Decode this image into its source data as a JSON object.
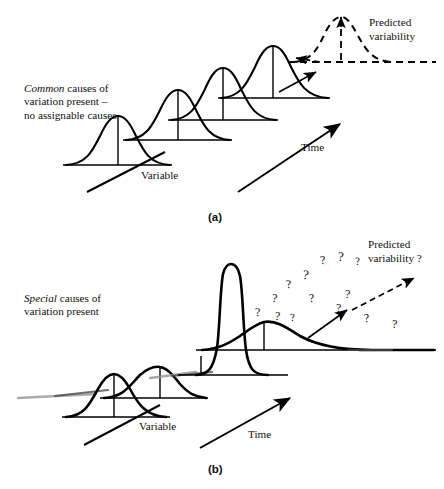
{
  "figure": {
    "background_color": "#ffffff",
    "ink_color": "#000000"
  },
  "panel_a": {
    "caption": "(a)",
    "note_emphasis": "Common",
    "note_rest": " causes of\nvariation present –\nno assignable causes",
    "note_line1_em": "Common",
    "note_line1_rest": " causes of",
    "note_line2": "variation present –",
    "note_line3": "no assignable causes",
    "variable_axis_label": "Variable",
    "time_axis_label": "Time",
    "predicted_label_line1": "Predicted",
    "predicted_label_line2": "variability"
  },
  "panel_b": {
    "caption": "(b)",
    "note_line1_em": "Special",
    "note_line1_rest": " causes of",
    "note_line2": "variation present",
    "variable_axis_label": "Variable",
    "time_axis_label": "Time",
    "predicted_label_line1": "Predicted",
    "predicted_label_line2": "variability ?",
    "question_marks": [
      "?",
      "?",
      "?",
      "?",
      "?",
      "?",
      "?",
      "?",
      "?",
      "?",
      "?",
      "?",
      "?",
      "?"
    ]
  },
  "chart_data": {
    "type": "line",
    "xlabel": "Variable",
    "ylabel": "",
    "grid": false,
    "legend_position": "none",
    "panels": [
      {
        "id": "a",
        "caption": "(a)",
        "description": "Common causes of variation present - no assignable causes. Four identical stable normal distributions shifting up and to the right along the Time axis, plus one dashed predicted distribution.",
        "distributions": [
          {
            "index": 1,
            "style": "solid",
            "center_x": 118,
            "baseline_y": 165,
            "peak_y": 116,
            "half_width": 53,
            "shape": "normal",
            "stable": true
          },
          {
            "index": 2,
            "style": "solid",
            "center_x": 178,
            "baseline_y": 140,
            "peak_y": 90,
            "half_width": 53,
            "shape": "normal",
            "stable": true
          },
          {
            "index": 3,
            "style": "solid",
            "center_x": 222,
            "baseline_y": 120,
            "peak_y": 68,
            "half_width": 53,
            "shape": "normal",
            "stable": true
          },
          {
            "index": 4,
            "style": "solid",
            "center_x": 272,
            "baseline_y": 98,
            "peak_y": 47,
            "half_width": 53,
            "shape": "normal",
            "stable": true
          },
          {
            "index": 5,
            "style": "dashed",
            "center_x": 340,
            "baseline_y": 62,
            "peak_y": 17,
            "half_width": 52,
            "shape": "normal",
            "stable": true,
            "label": "Predicted variability"
          }
        ],
        "axes": {
          "time_arrow": true,
          "variable_arrow": true
        }
      },
      {
        "id": "b",
        "caption": "(b)",
        "description": "Special causes of variation present. Distributions change shape and spread unpredictably; predicted variability is unknown, shown with question marks.",
        "distributions": [
          {
            "index": 1,
            "style": "solid",
            "center_x": 110,
            "baseline_y": 417,
            "peak_y": 375,
            "half_width": 48,
            "shape": "normal",
            "stable": false
          },
          {
            "index": 2,
            "style": "solid",
            "center_x": 158,
            "baseline_y": 398,
            "peak_y": 368,
            "half_width": 50,
            "shape": "wide-flat",
            "stable": false
          },
          {
            "index": 3,
            "style": "solid",
            "center_x": 224,
            "baseline_y": 375,
            "peak_y": 265,
            "half_width": 32,
            "shape": "tall-narrow",
            "stable": false
          },
          {
            "index": 4,
            "style": "solid",
            "center_x": 268,
            "baseline_y": 350,
            "peak_y": 305,
            "half_width": 95,
            "shape": "skewed-right",
            "stable": false
          }
        ],
        "axes": {
          "time_arrow": true,
          "variable_arrow": true
        },
        "uncertainty_marker_count": 14
      }
    ]
  }
}
